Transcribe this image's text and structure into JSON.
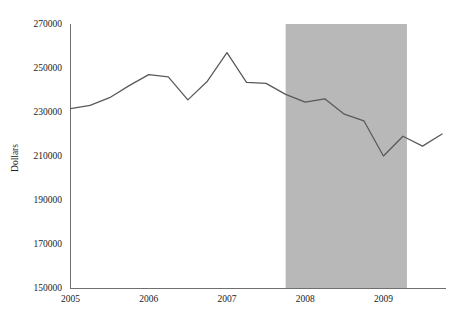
{
  "chart_data": {
    "type": "line",
    "title": "",
    "xlabel": "",
    "ylabel": "Dollars",
    "ylim": [
      150000,
      270000
    ],
    "yticks": [
      150000,
      170000,
      190000,
      210000,
      230000,
      250000,
      270000
    ],
    "ytick_labels": [
      "150000",
      "170000",
      "190000",
      "210000",
      "230000",
      "250000",
      "270000"
    ],
    "xlim": [
      2005.0,
      2009.8
    ],
    "xticks": [
      2005,
      2006,
      2007,
      2008,
      2009
    ],
    "xtick_labels": [
      "2005",
      "2006",
      "2007",
      "2008",
      "2009"
    ],
    "grid": false,
    "legend": "none",
    "series": [
      {
        "name": "Median home price",
        "color": "#59595b",
        "x": [
          2005.0,
          2005.25,
          2005.5,
          2005.75,
          2006.0,
          2006.25,
          2006.5,
          2006.75,
          2007.0,
          2007.25,
          2007.5,
          2007.75,
          2008.0,
          2008.25,
          2008.5,
          2008.75,
          2009.0,
          2009.25,
          2009.5,
          2009.75
        ],
        "values": [
          231500,
          233000,
          236500,
          242000,
          247000,
          246000,
          235500,
          244000,
          257000,
          243500,
          243000,
          238000,
          234500,
          236000,
          229000,
          226000,
          210000,
          219000,
          214500,
          220000
        ]
      }
    ],
    "annotations": [
      {
        "type": "shaded-span",
        "label": "recession-band",
        "x_start": 2007.75,
        "x_end": 2009.3,
        "color": "#b8b8b8"
      }
    ],
    "axis_color": "#6f6f70"
  }
}
